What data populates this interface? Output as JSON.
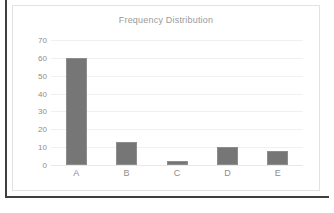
{
  "chart_data": {
    "type": "bar",
    "title": "Frequency Distribution",
    "xlabel": "",
    "ylabel": "",
    "categories": [
      "A",
      "B",
      "C",
      "D",
      "E"
    ],
    "values": [
      60,
      13,
      2,
      10,
      8
    ],
    "ylim": [
      0,
      70
    ],
    "y_ticks": [
      0,
      10,
      20,
      30,
      40,
      50,
      60,
      70
    ],
    "y_tick_labels": [
      "0",
      "10",
      "20",
      "30",
      "40",
      "50",
      "60",
      "70"
    ],
    "grid": true,
    "legend": false,
    "legend_position": "none",
    "series": [
      {
        "name": "Frequency",
        "values": [
          60,
          13,
          2,
          10,
          8
        ]
      }
    ]
  },
  "style": {
    "bar_color": "#767676",
    "bar_border_color": "#8d8d8d",
    "grid_color": "#f0f0f0",
    "axis_text_color": "#8e8e8e",
    "title_color": "#9a9a9a",
    "panel_background": "#ffffff",
    "panel_border_color": "#e2e2e2",
    "frame_color": "#3f3f3f"
  }
}
